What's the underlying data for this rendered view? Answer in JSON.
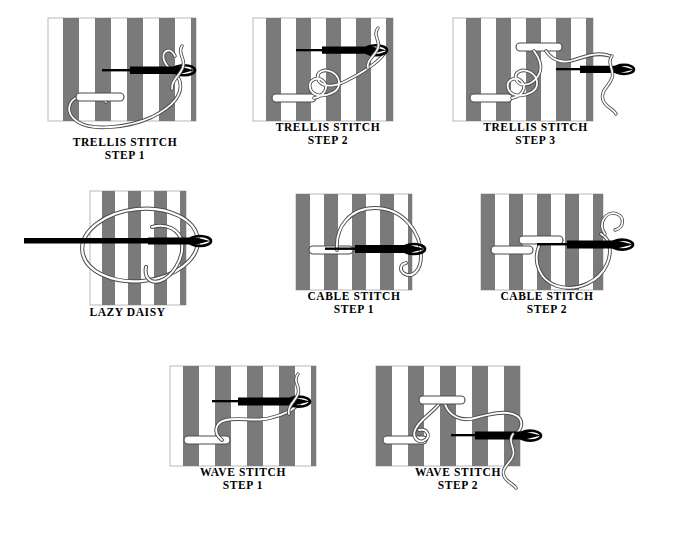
{
  "document": {
    "title": "Embroidery Stitch Diagrams",
    "background_color": "#ffffff",
    "width": 688,
    "height": 548
  },
  "style": {
    "fabric_stripe_dark": "#7a7a7a",
    "fabric_stripe_light": "#ffffff",
    "panel_border": "#b9b9b9",
    "needle_color": "#000000",
    "thread_outline": "#4d4d4d",
    "thread_fill": "#ffffff",
    "caption_color": "#000000"
  },
  "figures": [
    {
      "id": "trellis-step-1",
      "caption_line1": "TRELLIS STITCH",
      "caption_line2": "STEP 1",
      "panel": {
        "x": 48,
        "y": 18,
        "width": 148,
        "height": 103,
        "stripes": 9
      },
      "caption_pos": {
        "x": 28,
        "y": 136,
        "width": 190
      }
    },
    {
      "id": "trellis-step-2",
      "caption_line1": "TRELLIS STITCH",
      "caption_line2": "STEP 2",
      "panel": {
        "x": 253,
        "y": 18,
        "width": 140,
        "height": 103,
        "stripes": 9
      },
      "caption_pos": {
        "x": 228,
        "y": 121,
        "width": 190
      }
    },
    {
      "id": "trellis-step-3",
      "caption_line1": "TRELLIS STITCH",
      "caption_line2": "STEP 3",
      "panel": {
        "x": 453,
        "y": 18,
        "width": 140,
        "height": 103,
        "stripes": 9
      },
      "caption_pos": {
        "x": 428,
        "y": 121,
        "width": 190
      }
    },
    {
      "id": "lazy-daisy",
      "caption_line1": "LAZY DAISY",
      "caption_line2": "",
      "panel": {
        "x": 90,
        "y": 191,
        "width": 96,
        "height": 114,
        "stripes": 7
      },
      "caption_pos": {
        "x": 43,
        "y": 312,
        "width": 190
      }
    },
    {
      "id": "cable-step-1",
      "caption_line1": "CABLE STITCH",
      "caption_line2": "STEP 1",
      "panel": {
        "x": 296,
        "y": 194,
        "width": 116,
        "height": 96,
        "stripes": 8
      },
      "caption_pos": {
        "x": 259,
        "y": 290,
        "width": 190
      }
    },
    {
      "id": "cable-step-2",
      "caption_line1": "CABLE STITCH",
      "caption_line2": "STEP 2",
      "panel": {
        "x": 481,
        "y": 194,
        "width": 122,
        "height": 96,
        "stripes": 8
      },
      "caption_pos": {
        "x": 447,
        "y": 290,
        "width": 190
      }
    },
    {
      "id": "wave-step-1",
      "caption_line1": "WAVE STITCH",
      "caption_line2": "STEP 1",
      "panel": {
        "x": 170,
        "y": 367,
        "width": 146,
        "height": 100,
        "stripes": 9
      },
      "caption_pos": {
        "x": 148,
        "y": 466,
        "width": 190
      }
    },
    {
      "id": "wave-step-2",
      "caption_line1": "WAVE STITCH",
      "caption_line2": "STEP 2",
      "panel": {
        "x": 376,
        "y": 367,
        "width": 144,
        "height": 100,
        "stripes": 9
      },
      "caption_pos": {
        "x": 353,
        "y": 466,
        "width": 190
      }
    }
  ]
}
